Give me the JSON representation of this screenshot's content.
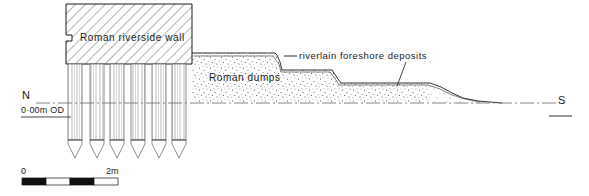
{
  "figure": {
    "type": "archaeological-section-drawing",
    "title_visible": false,
    "background_color": "#ffffff",
    "ink_color": "#1a1a1a"
  },
  "labels": {
    "wall": "Roman riverside wall",
    "dumps": "Roman dumps",
    "foreshore": "riverlain foreshore deposits",
    "north": "N",
    "south": "S",
    "datum": "0·00m OD"
  },
  "scale_bar": {
    "start_label": "0",
    "end_label": "2m",
    "segments": 4,
    "segment_colors": [
      "#111111",
      "#ffffff",
      "#111111",
      "#ffffff"
    ],
    "x": 22,
    "y": 178,
    "width": 96,
    "height": 7
  },
  "wall": {
    "x": 66,
    "y": 4,
    "width": 126,
    "height": 60,
    "hatch_angle_deg": 45,
    "hatch_spacing_px": 7,
    "notch": {
      "x": 66,
      "y": 35,
      "depth": 6
    }
  },
  "piles": {
    "count": 6,
    "top_y": 64,
    "shaft_bottom_y": 140,
    "tip_bottom_y": 158,
    "width": 14,
    "x_positions": [
      68,
      90,
      110,
      131,
      152,
      172
    ],
    "grain_lines_per_pile": 5
  },
  "datum_line": {
    "y": 103,
    "x_start": 36,
    "x_end": 560,
    "style": "dash-dot"
  },
  "deposits": {
    "fill_pattern": "stipple",
    "outline_color": "#1a1a1a",
    "profile_points": "stepped-descending",
    "steps": [
      {
        "x": 192,
        "y": 53
      },
      {
        "x": 275,
        "y": 53
      },
      {
        "x": 282,
        "y": 70
      },
      {
        "x": 332,
        "y": 70
      },
      {
        "x": 340,
        "y": 82
      },
      {
        "x": 430,
        "y": 82
      },
      {
        "x": 460,
        "y": 95
      },
      {
        "x": 502,
        "y": 102
      }
    ]
  },
  "leader_lines": {
    "foreshore_dash": {
      "x1": 284,
      "y1": 56,
      "x2": 296,
      "y2": 56
    },
    "foreshore_drop": {
      "x1": 405,
      "y1": 60,
      "x2": 398,
      "y2": 85
    }
  },
  "south_marker": {
    "label_x": 560,
    "label_y": 102,
    "underline_x1": 550,
    "underline_x2": 572,
    "underline_y": 113
  },
  "north_marker": {
    "label_x": 22,
    "label_y": 96,
    "datum_x": 22,
    "datum_y": 110,
    "underline_x1": 21,
    "underline_x2": 70,
    "underline_y": 114
  }
}
